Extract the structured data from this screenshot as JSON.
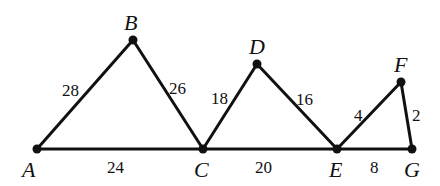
{
  "diagram": {
    "colors": {
      "stroke": "#111111",
      "background": "#ffffff"
    },
    "points": [
      {
        "id": "A",
        "label": "A",
        "x": 37,
        "y": 149,
        "lx": 22,
        "ly": 177
      },
      {
        "id": "B",
        "label": "B",
        "x": 133,
        "y": 40,
        "lx": 124,
        "ly": 30
      },
      {
        "id": "C",
        "label": "C",
        "x": 203,
        "y": 149,
        "lx": 194,
        "ly": 177
      },
      {
        "id": "D",
        "label": "D",
        "x": 257,
        "y": 64,
        "lx": 249,
        "ly": 54
      },
      {
        "id": "E",
        "label": "E",
        "x": 337,
        "y": 149,
        "lx": 329,
        "ly": 177
      },
      {
        "id": "F",
        "label": "F",
        "x": 401,
        "y": 82,
        "lx": 394,
        "ly": 72
      },
      {
        "id": "G",
        "label": "G",
        "x": 412,
        "y": 149,
        "lx": 404,
        "ly": 177
      }
    ],
    "segments": [
      {
        "id": "AB",
        "from": "A",
        "to": "B",
        "length": "28",
        "lx": 62,
        "ly": 96
      },
      {
        "id": "BC",
        "from": "B",
        "to": "C",
        "length": "26",
        "lx": 169,
        "ly": 94
      },
      {
        "id": "AC",
        "from": "A",
        "to": "C",
        "length": "24",
        "lx": 107,
        "ly": 173
      },
      {
        "id": "CD",
        "from": "C",
        "to": "D",
        "length": "18",
        "lx": 211,
        "ly": 104
      },
      {
        "id": "DE",
        "from": "D",
        "to": "E",
        "length": "16",
        "lx": 296,
        "ly": 105
      },
      {
        "id": "CE",
        "from": "C",
        "to": "E",
        "length": "20",
        "lx": 255,
        "ly": 173
      },
      {
        "id": "EF",
        "from": "E",
        "to": "F",
        "length": "4",
        "lx": 354,
        "ly": 121
      },
      {
        "id": "FG",
        "from": "F",
        "to": "G",
        "length": "2",
        "lx": 412,
        "ly": 121
      },
      {
        "id": "EG",
        "from": "E",
        "to": "G",
        "length": "8",
        "lx": 370,
        "ly": 173
      }
    ]
  }
}
